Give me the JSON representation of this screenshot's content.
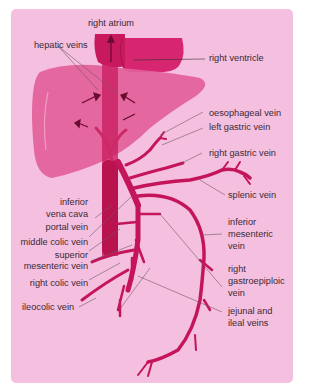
{
  "figure": {
    "background_color": "#f5bfe0",
    "vein_color": "#c4145a",
    "organ_color": "#e0558f",
    "labels": {
      "right_atrium": "right atrium",
      "hepatic_veins": "hepatic veins",
      "right_ventricle": "right ventricle",
      "oesophageal_vein": "oesophageal vein",
      "left_gastric_vein": "left gastric vein",
      "right_gastric_vein": "right gastric vein",
      "splenic_vein": "splenic vein",
      "inferior_vena_cava_1": "inferior",
      "inferior_vena_cava_2": "vena cava",
      "portal_vein": "portal vein",
      "inferior_mesenteric_vein_1": "inferior",
      "inferior_mesenteric_vein_2": "mesenteric",
      "inferior_mesenteric_vein_3": "vein",
      "middle_colic_vein": "middle colic vein",
      "superior_mesenteric_vein_1": "superior",
      "superior_mesenteric_vein_2": "mesenteric vein",
      "right_colic_vein": "right colic vein",
      "right_gastroepiploic_vein_1": "right",
      "right_gastroepiploic_vein_2": "gastroepiploic",
      "right_gastroepiploic_vein_3": "vein",
      "ileocolic_vein": "ileocolic vein",
      "jejunal_ileal_veins_1": "jejunal and",
      "jejunal_ileal_veins_2": "ileal veins"
    }
  }
}
